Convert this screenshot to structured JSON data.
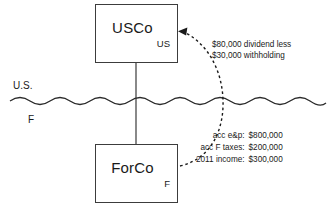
{
  "diagram": {
    "entities": [
      {
        "name": "USCo",
        "jurisdiction": "US"
      },
      {
        "name": "ForCo",
        "jurisdiction": "F"
      }
    ],
    "border": {
      "upper_label": "U.S.",
      "lower_label": "F",
      "style": "wavy-line"
    },
    "flow_note": {
      "line1": "$80,000 dividend less",
      "line2": "$30,000 withholding"
    },
    "financials": {
      "rows": [
        {
          "label": "acc e&p:",
          "value": "$800,000"
        },
        {
          "label": "acc F taxes:",
          "value": "$200,000"
        },
        {
          "label": "2011 income:",
          "value": "$300,000"
        }
      ]
    },
    "colors": {
      "box_stroke": "#3c3c3c",
      "connector": "#6b6b6b",
      "arrow": "#1a1a1a",
      "border_line": "#2b2b2b",
      "text": "#1a1a1a",
      "background": "#ffffff"
    }
  }
}
